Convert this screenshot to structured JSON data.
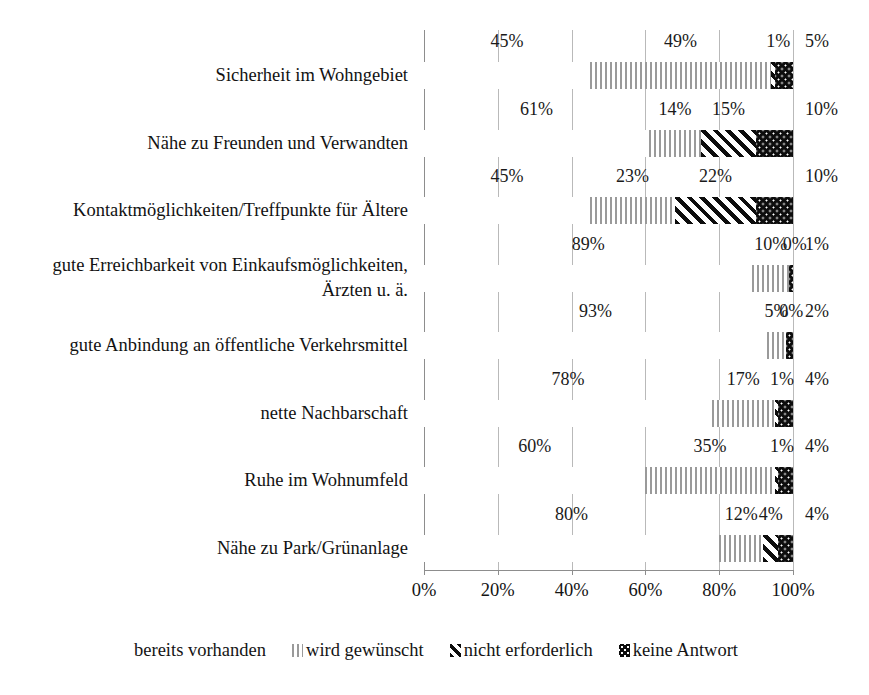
{
  "chart_data": {
    "type": "bar",
    "orientation": "horizontal",
    "stacked": true,
    "title": "",
    "xlabel": "",
    "ylabel": "",
    "xlim": [
      0,
      100
    ],
    "grid": true,
    "legend_position": "bottom",
    "xticks": [
      "0%",
      "20%",
      "40%",
      "60%",
      "80%",
      "100%"
    ],
    "xtick_values": [
      0,
      20,
      40,
      60,
      80,
      100
    ],
    "categories": [
      "Sicherheit im Wohngebiet",
      "Nähe zu Freunden und Verwandten",
      "Kontaktmöglichkeiten/Treffpunkte für Ältere",
      "gute Erreichbarkeit von Einkaufsmöglichkeiten, Ärzten u. ä.",
      "gute Anbindung an öffentliche Verkehrsmittel",
      "nette Nachbarschaft",
      "Ruhe im Wohnumfeld",
      "Nähe zu Park/Grünanlage"
    ],
    "category_lines": [
      [
        "Sicherheit im Wohngebiet"
      ],
      [
        "Nähe zu Freunden und Verwandten"
      ],
      [
        "Kontaktmöglichkeiten/Treffpunkte für Ältere"
      ],
      [
        "gute Erreichbarkeit von Einkaufsmöglichkeiten,",
        "Ärzten u. ä."
      ],
      [
        "gute Anbindung an öffentliche Verkehrsmittel"
      ],
      [
        "nette Nachbarschaft"
      ],
      [
        "Ruhe im Wohnumfeld"
      ],
      [
        "Nähe zu Park/Grünanlage"
      ]
    ],
    "series": [
      {
        "name": "bereits vorhanden",
        "values": [
          45,
          61,
          45,
          89,
          93,
          78,
          60,
          80
        ]
      },
      {
        "name": "wird gewünscht",
        "values": [
          49,
          14,
          23,
          10,
          5,
          17,
          35,
          12
        ]
      },
      {
        "name": "nicht erforderlich",
        "values": [
          1,
          15,
          22,
          0,
          0,
          1,
          1,
          4
        ]
      },
      {
        "name": "keine Antwort",
        "values": [
          5,
          10,
          10,
          1,
          2,
          4,
          4,
          4
        ]
      }
    ],
    "value_labels": [
      [
        "45%",
        "49%",
        "1%",
        "5%"
      ],
      [
        "61%",
        "14%",
        "15%",
        "10%"
      ],
      [
        "45%",
        "23%",
        "22%",
        "10%"
      ],
      [
        "89%",
        "10%",
        "0%",
        "1%"
      ],
      [
        "93%",
        "5%",
        "0%",
        "2%"
      ],
      [
        "78%",
        "17%",
        "1%",
        "4%"
      ],
      [
        "60%",
        "35%",
        "1%",
        "4%"
      ],
      [
        "80%",
        "12%",
        "4%",
        "4%"
      ]
    ]
  },
  "legend": {
    "items": [
      {
        "label": "bereits vorhanden",
        "key": "blank-swatch"
      },
      {
        "label": "wird gewünscht",
        "key": "vertical-lines-swatch"
      },
      {
        "label": "nicht erforderlich",
        "key": "diagonal-stripes-swatch"
      },
      {
        "label": "keine Antwort",
        "key": "black-dotted-swatch"
      }
    ]
  },
  "colors": {
    "ink": "#141414",
    "grid": "#b9b9b9",
    "axis": "#8d8d8d",
    "pattern_dark": "#0d0d0d",
    "pattern_gray": "#9a9a9a",
    "background": "#ffffff"
  }
}
